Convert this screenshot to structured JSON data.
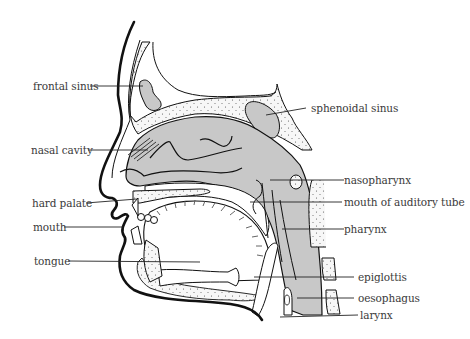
{
  "figure": {
    "colors": {
      "outline": "#111111",
      "cavity_fill": "#c8c8c8",
      "bone_fill": "#f4f4f4",
      "label_text": "#3a3a3a",
      "leader_line": "#222222"
    },
    "labels_left": [
      {
        "id": "frontal-sinus",
        "text": "frontal sinus"
      },
      {
        "id": "nasal-cavity",
        "text": "nasal cavity"
      },
      {
        "id": "hard-palate",
        "text": "hard palate"
      },
      {
        "id": "mouth",
        "text": "mouth"
      },
      {
        "id": "tongue",
        "text": "tongue"
      }
    ],
    "labels_right": [
      {
        "id": "sphenoidal-sinus",
        "text": "sphenoidal sinus"
      },
      {
        "id": "nasopharynx",
        "text": "nasopharynx"
      },
      {
        "id": "mouth-of-auditory-tube",
        "text": "mouth of auditory tube"
      },
      {
        "id": "pharynx",
        "text": "pharynx"
      },
      {
        "id": "epiglottis",
        "text": "epiglottis"
      },
      {
        "id": "oesophagus",
        "text": "oesophagus"
      },
      {
        "id": "larynx",
        "text": "larynx"
      }
    ]
  }
}
